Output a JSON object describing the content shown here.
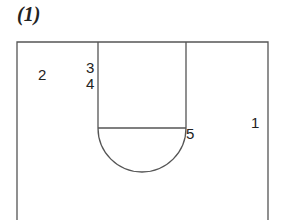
{
  "title": "(1)",
  "court": {
    "line_color": "#555555",
    "positions": [
      {
        "label": "1",
        "x": 251,
        "y": 115
      },
      {
        "label": "2",
        "x": 38,
        "y": 67
      },
      {
        "label": "3",
        "x": 86,
        "y": 60
      },
      {
        "label": "4",
        "x": 86,
        "y": 76
      },
      {
        "label": "5",
        "x": 186,
        "y": 126
      }
    ]
  }
}
